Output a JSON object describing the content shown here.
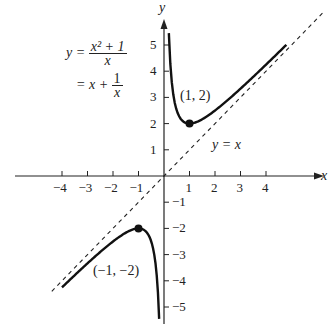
{
  "chart_data": {
    "type": "line",
    "title": "",
    "xlabel": "x",
    "ylabel": "y",
    "xlim": [
      -4.5,
      6.5
    ],
    "ylim": [
      -5.5,
      5.8
    ],
    "grid": false,
    "x_ticks": [
      -4,
      -3,
      -2,
      -1,
      1,
      2,
      3,
      4
    ],
    "y_ticks": [
      -5,
      -4,
      -3,
      -2,
      -1,
      1,
      2,
      3,
      4,
      5
    ],
    "x_tick_labels": [
      "−4",
      "−3",
      "−2",
      "−1",
      "1",
      "2",
      "3",
      "4"
    ],
    "y_tick_labels": [
      "−5",
      "−4",
      "−3",
      "−2",
      "−1",
      "1",
      "2",
      "3",
      "4",
      "5"
    ],
    "series": [
      {
        "name": "y = (x^2+1)/x = x + 1/x (x>0)",
        "style": "solid",
        "x": [
          0.19,
          0.25,
          0.35,
          0.5,
          0.75,
          1,
          1.5,
          2,
          3,
          4,
          4.8
        ],
        "y": [
          5.45,
          4.25,
          3.21,
          2.5,
          2.08,
          2,
          2.17,
          2.5,
          3.33,
          4.25,
          5.01
        ]
      },
      {
        "name": "y = (x^2+1)/x = x + 1/x (x<0)",
        "style": "solid",
        "x": [
          -4,
          -3,
          -2,
          -1.5,
          -1,
          -0.75,
          -0.5,
          -0.35,
          -0.25,
          -0.19
        ],
        "y": [
          -4.25,
          -3.33,
          -2.5,
          -2.17,
          -2,
          -2.08,
          -2.5,
          -3.21,
          -4.25,
          -5.45
        ]
      },
      {
        "name": "y = x (asymptote)",
        "style": "dashed",
        "x": [
          -4.4,
          6.3
        ],
        "y": [
          -4.4,
          6.3
        ]
      }
    ],
    "points": [
      {
        "x": 1,
        "y": 2,
        "label": "(1, 2)"
      },
      {
        "x": -1,
        "y": -2,
        "label": "(−1, −2)"
      }
    ],
    "annotations": [
      "y = (x² + 1)/x",
      "= x + 1/x",
      "y = x",
      "(1, 2)",
      "(−1, −2)"
    ]
  },
  "labels": {
    "axis_x": "x",
    "axis_y": "y",
    "eq_lhs": "y =",
    "eq_num": "x² + 1",
    "eq_den": "x",
    "eq2_eq": "= x +",
    "eq2_num": "1",
    "eq2_den": "x",
    "asymptote": "y = x",
    "pt_pos": "(1, 2)",
    "pt_neg": "(−1, −2)",
    "xt": [
      "−4",
      "−3",
      "−2",
      "−1",
      "1",
      "2",
      "3",
      "4"
    ],
    "yt_pos": [
      "1",
      "2",
      "3",
      "4",
      "5"
    ],
    "yt_neg": [
      "−1",
      "−2",
      "−3",
      "−4",
      "−5"
    ]
  }
}
